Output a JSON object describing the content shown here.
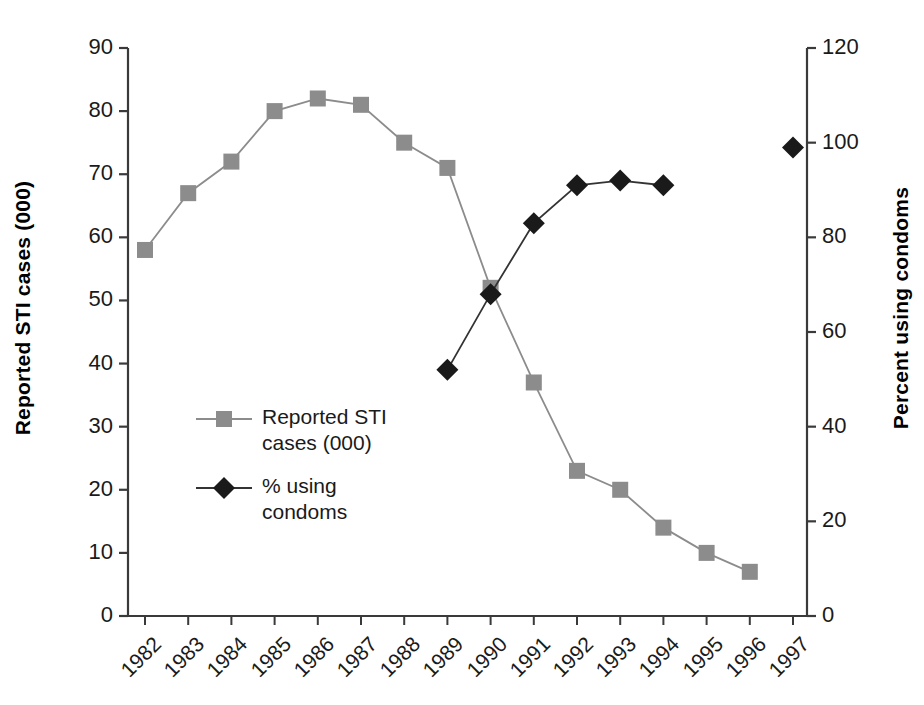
{
  "chart_data": {
    "type": "line",
    "title": "",
    "xlabel": "",
    "categories": [
      "1982",
      "1983",
      "1984",
      "1985",
      "1986",
      "1987",
      "1988",
      "1989",
      "1990",
      "1991",
      "1992",
      "1993",
      "1994",
      "1995",
      "1996",
      "1997"
    ],
    "grid": false,
    "legend_position": "inside-left",
    "axes": {
      "left": {
        "label": "Reported STI cases (000)",
        "ticks": [
          "0",
          "10",
          "20",
          "30",
          "40",
          "50",
          "60",
          "70",
          "80",
          "90"
        ],
        "tick_values": [
          0,
          10,
          20,
          30,
          40,
          50,
          60,
          70,
          80,
          90
        ],
        "ylim": [
          0,
          90
        ]
      },
      "right": {
        "label": "Percent using condoms",
        "ticks": [
          "0",
          "20",
          "40",
          "60",
          "80",
          "100",
          "120"
        ],
        "tick_values": [
          0,
          20,
          40,
          60,
          80,
          100,
          120
        ],
        "ylim": [
          0,
          120
        ]
      }
    },
    "series": [
      {
        "name": "Reported STI\ncases (000)",
        "legend_label": "Reported STI\ncases (000)",
        "axis": "left",
        "marker": "square",
        "color": "#8c8c8c",
        "line_color": "#8c8c8c",
        "x": [
          "1982",
          "1983",
          "1984",
          "1985",
          "1986",
          "1987",
          "1988",
          "1989",
          "1990",
          "1991",
          "1992",
          "1993",
          "1994",
          "1995",
          "1996"
        ],
        "values": [
          58,
          67,
          72,
          80,
          82,
          81,
          75,
          71,
          52,
          37,
          23,
          20,
          14,
          10,
          7
        ]
      },
      {
        "name": "% using\ncondoms",
        "legend_label": "% using\ncondoms",
        "axis": "right",
        "marker": "diamond",
        "color": "#1a1a1a",
        "line_color": "#333333",
        "x": [
          "1989",
          "1990",
          "1991",
          "1992",
          "1993",
          "1994"
        ],
        "values": [
          52,
          68,
          83,
          91,
          92,
          91
        ],
        "x_extra": [
          "1997"
        ],
        "values_extra": [
          99
        ]
      }
    ]
  },
  "legend": {
    "items": [
      {
        "label": "Reported STI\ncases (000)",
        "marker": "square",
        "color": "#8c8c8c"
      },
      {
        "label": "% using\ncondoms",
        "marker": "diamond",
        "color": "#1a1a1a"
      }
    ]
  }
}
